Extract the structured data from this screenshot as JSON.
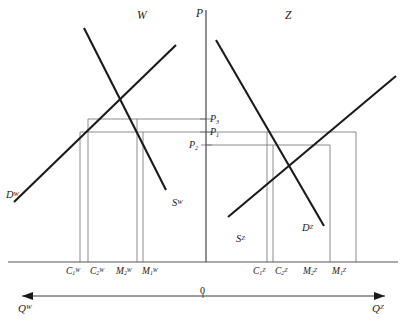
{
  "figure": {
    "type": "economics-two-panel-supply-demand",
    "panels": {
      "left": {
        "label": "W",
        "label_x": 137,
        "label_y": 10
      },
      "right": {
        "label": "Z",
        "label_x": 285,
        "label_y": 10
      }
    },
    "vertical_axis": {
      "label": "P",
      "label_x": 196,
      "label_y": 8,
      "x": 206,
      "y_top": 10,
      "y_bottom": 262
    },
    "horizontal_axis": {
      "y": 262,
      "x_left": 8,
      "x_right": 398
    },
    "origin": {
      "label": "0",
      "x": 203,
      "y": 291
    },
    "direction_axis": {
      "y": 296,
      "x_left": 22,
      "x_right": 385,
      "left_label": "Q",
      "left_sup": "W",
      "right_label": "Q",
      "right_sup": "Z",
      "left_label_x": 18,
      "left_label_y": 306,
      "right_label_x": 374,
      "right_label_y": 306
    },
    "curves": [
      {
        "name": "demand-w",
        "label": "D",
        "superscript": "W",
        "label_x": 6,
        "label_y": 190,
        "x1": 14,
        "y1": 202,
        "x2": 176,
        "y2": 45
      },
      {
        "name": "supply-w",
        "label": "S",
        "superscript": "W",
        "label_x": 172,
        "label_y": 198,
        "x1": 84,
        "y1": 28,
        "x2": 166,
        "y2": 190
      },
      {
        "name": "supply-z",
        "label": "S",
        "superscript": "Z",
        "label_x": 236,
        "label_y": 234,
        "x1": 228,
        "y1": 217,
        "x2": 396,
        "y2": 76
      },
      {
        "name": "demand-z",
        "label": "D",
        "superscript": "Z",
        "label_x": 302,
        "label_y": 223,
        "x1": 216,
        "y1": 40,
        "x2": 324,
        "y2": 226
      }
    ],
    "price_lines": [
      {
        "name": "P3",
        "label": "P",
        "subscript": "3",
        "y": 119,
        "label_x": 210,
        "label_y": 115,
        "left_x1": 88,
        "left_x2": 206,
        "right_x1": 206,
        "right_x2": 206
      },
      {
        "name": "P1",
        "label": "P",
        "subscript": "1",
        "y": 132,
        "label_x": 210,
        "label_y": 128,
        "left_x1": 80,
        "left_x2": 206,
        "right_x1": 206,
        "right_x2": 356
      },
      {
        "name": "P2",
        "label": "P",
        "subscript": "2",
        "y": 145,
        "label_x": 191,
        "label_y": 141,
        "left_x1": 206,
        "left_x2": 206,
        "right_x1": 206,
        "right_x2": 330
      }
    ],
    "quantity_markers": [
      {
        "name": "C1W",
        "label": "C",
        "subscript": "1",
        "superscript": "W",
        "x": 80,
        "y_top": 132,
        "label_x": 66,
        "label_y": 272
      },
      {
        "name": "C2W",
        "label": "C",
        "subscript": "2",
        "superscript": "W",
        "x": 88,
        "y_top": 119,
        "label_x": 88,
        "label_y": 272
      },
      {
        "name": "M2W",
        "label": "M",
        "subscript": "2",
        "superscript": "W",
        "x": 137,
        "y_top": 119,
        "label_x": 111,
        "label_y": 272
      },
      {
        "name": "M1W",
        "label": "M",
        "subscript": "1",
        "superscript": "W",
        "x": 143,
        "y_top": 132,
        "label_x": 137,
        "label_y": 272
      },
      {
        "name": "C1Z",
        "label": "C",
        "subscript": "1",
        "superscript": "Z",
        "x": 267,
        "y_top": 132,
        "label_x": 252,
        "label_y": 272
      },
      {
        "name": "C2Z",
        "label": "C",
        "subscript": "2",
        "superscript": "Z",
        "x": 273,
        "y_top": 145,
        "label_x": 273,
        "label_y": 272
      },
      {
        "name": "M2Z",
        "label": "M",
        "subscript": "2",
        "superscript": "Z",
        "x": 330,
        "y_top": 145,
        "label_x": 302,
        "label_y": 272
      },
      {
        "name": "M1Z",
        "label": "M",
        "subscript": "1",
        "superscript": "Z",
        "x": 356,
        "y_top": 132,
        "label_x": 330,
        "label_y": 272
      }
    ],
    "colors": {
      "curve": "#1a1a1a",
      "thin_line": "#6e6e6e",
      "axis": "#4a4a4a",
      "text": "#1a1a1a",
      "background": "#ffffff"
    }
  }
}
